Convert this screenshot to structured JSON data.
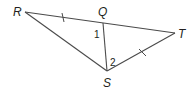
{
  "diagram": {
    "type": "geometry-figure",
    "points": {
      "R": {
        "label": "R",
        "x": 25,
        "y": 12
      },
      "Q": {
        "label": "Q",
        "x": 103,
        "y": 23
      },
      "T": {
        "label": "T",
        "x": 175,
        "y": 33
      },
      "S": {
        "label": "S",
        "x": 107,
        "y": 71
      }
    },
    "segments": [
      {
        "from": "R",
        "to": "T",
        "note": "Q lies on RT"
      },
      {
        "from": "R",
        "to": "S"
      },
      {
        "from": "Q",
        "to": "S"
      },
      {
        "from": "S",
        "to": "T"
      }
    ],
    "congruence_marks": [
      {
        "segment": "RQ",
        "ticks": 1
      },
      {
        "segment": "ST",
        "ticks": 1
      }
    ],
    "angles": [
      {
        "label": "1",
        "vertex": "Q",
        "description": "angle RQS"
      },
      {
        "label": "2",
        "vertex": "S",
        "description": "angle QST"
      }
    ],
    "colors": {
      "line": "#4a4a4a",
      "text": "#231f20",
      "background": "#ffffff"
    }
  }
}
